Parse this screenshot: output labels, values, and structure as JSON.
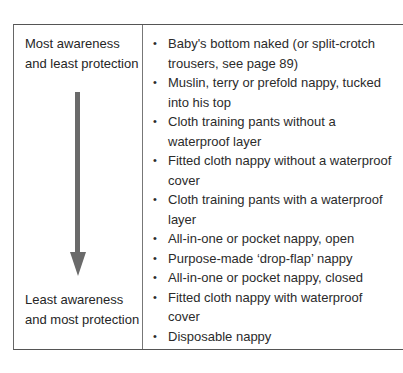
{
  "table": {
    "left_column": {
      "top_label": "Most awareness and least protection",
      "bottom_label": "Least awareness and most protection",
      "arrow": "arrow-down-icon"
    },
    "items": [
      {
        "bullet": "•",
        "text": "Baby's bottom naked (or split-crotch trousers, see page 89)"
      },
      {
        "bullet": "•",
        "text": "Muslin, terry or prefold nappy, tucked into his top"
      },
      {
        "bullet": "•",
        "text": "Cloth training pants without a waterproof layer"
      },
      {
        "bullet": "•",
        "text": "Fitted cloth nappy without a waterproof cover"
      },
      {
        "bullet": "•",
        "text": "Cloth training pants with a waterproof layer"
      },
      {
        "bullet": "•",
        "text": "All-in-one or pocket nappy, open"
      },
      {
        "bullet": "•",
        "text": "Purpose-made ‘drop-flap’ nappy"
      },
      {
        "bullet": "•",
        "text": "All-in-one or pocket nappy, closed"
      },
      {
        "bullet": "•",
        "text": "Fitted cloth nappy with waterproof cover"
      },
      {
        "bullet": "•",
        "text": "Disposable nappy"
      }
    ]
  },
  "colors": {
    "border": "#555555",
    "arrow": "#6a6a6a",
    "text": "#2b2b2b"
  }
}
